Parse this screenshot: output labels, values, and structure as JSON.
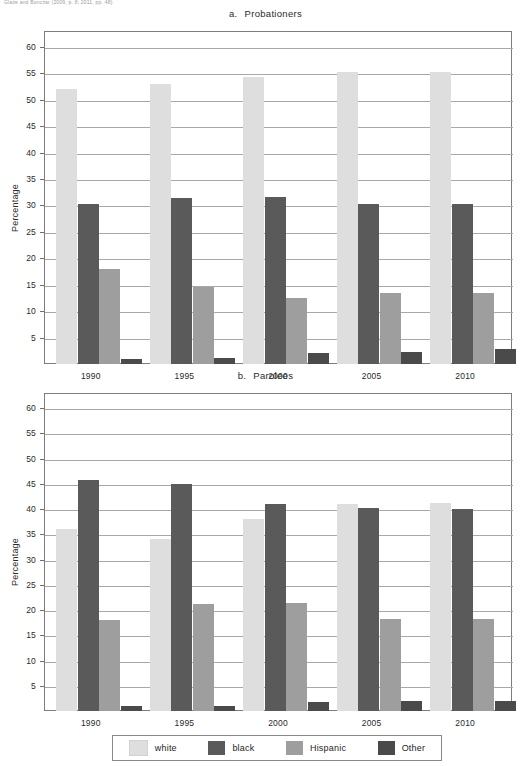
{
  "page": {
    "top_citation": "Glaze and Bonczar (2009, p. 8; 2011, pp. 48)"
  },
  "legend": {
    "position": "bottom-center",
    "items": [
      {
        "label": "white",
        "color": "#dedede"
      },
      {
        "label": "black",
        "color": "#5a5a5a"
      },
      {
        "label": "Hispanic",
        "color": "#9e9e9e"
      },
      {
        "label": "Other",
        "color": "#4a4a4a"
      }
    ]
  },
  "chart_data": [
    {
      "type": "bar",
      "panel": "a",
      "panel_letter": "a.",
      "title": "Probationers",
      "xlabel": "",
      "ylabel": "Percentage",
      "categories": [
        "1990",
        "1995",
        "2000",
        "2005",
        "2010"
      ],
      "ylim": [
        0,
        63
      ],
      "yticks": [
        5,
        10,
        15,
        20,
        25,
        30,
        35,
        40,
        45,
        50,
        55,
        60
      ],
      "grid": true,
      "legend_position": "bottom-center",
      "series": [
        {
          "name": "white",
          "color": "#dedede",
          "values": [
            52.0,
            53.0,
            54.3,
            55.3,
            55.3
          ]
        },
        {
          "name": "black",
          "color": "#5a5a5a",
          "values": [
            30.3,
            31.5,
            31.6,
            30.3,
            30.3
          ]
        },
        {
          "name": "Hispanic",
          "color": "#9e9e9e",
          "values": [
            18.0,
            14.5,
            12.5,
            13.5,
            13.5
          ]
        },
        {
          "name": "Other",
          "color": "#4a4a4a",
          "values": [
            1.0,
            1.2,
            2.0,
            2.2,
            2.8
          ]
        }
      ]
    },
    {
      "type": "bar",
      "panel": "b",
      "panel_letter": "b.",
      "title": "Parolees",
      "xlabel": "",
      "ylabel": "Percentage",
      "categories": [
        "1990",
        "1995",
        "2000",
        "2005",
        "2010"
      ],
      "ylim": [
        0,
        63
      ],
      "yticks": [
        5,
        10,
        15,
        20,
        25,
        30,
        35,
        40,
        45,
        50,
        55,
        60
      ],
      "grid": true,
      "legend_position": "bottom-center",
      "series": [
        {
          "name": "white",
          "color": "#dedede",
          "values": [
            36.0,
            34.0,
            38.0,
            41.0,
            41.2
          ]
        },
        {
          "name": "black",
          "color": "#5a5a5a",
          "values": [
            45.7,
            45.0,
            41.0,
            40.3,
            40.0
          ]
        },
        {
          "name": "Hispanic",
          "color": "#9e9e9e",
          "values": [
            18.0,
            21.2,
            21.4,
            18.3,
            18.3
          ]
        },
        {
          "name": "Other",
          "color": "#4a4a4a",
          "values": [
            1.0,
            1.0,
            1.8,
            2.0,
            2.0
          ]
        }
      ]
    }
  ]
}
